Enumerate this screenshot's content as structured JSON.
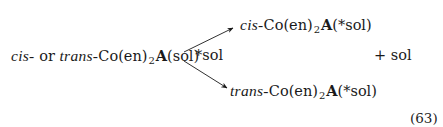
{
  "equation": {
    "reactant": {
      "prefix1": "cis-",
      "connector": " or ",
      "prefix2": "trans-",
      "formula_before_sub": "Co(en)",
      "subscript": "2",
      "formula_after_sub_bold": "A",
      "formula_tail": "(sol)"
    },
    "reagent": "*sol",
    "products": [
      {
        "prefix": "cis-",
        "formula_before_sub": "Co(en)",
        "subscript": "2",
        "formula_after_sub_bold": "A",
        "formula_tail": "(*sol)"
      },
      {
        "prefix": "trans-",
        "formula_before_sub": "Co(en)",
        "subscript": "2",
        "formula_after_sub_bold": "A",
        "formula_tail": "(*sol)"
      }
    ],
    "byproduct": "+ sol",
    "number": "(63)"
  }
}
